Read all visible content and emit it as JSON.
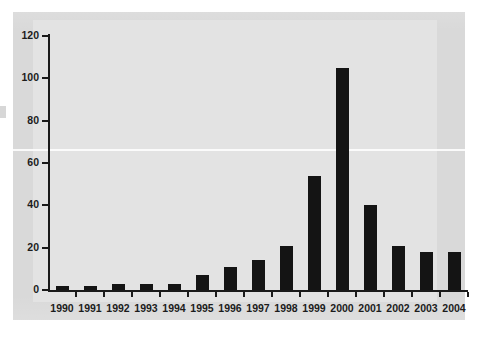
{
  "chart_data": {
    "type": "bar",
    "title": "",
    "subtitle": "",
    "xlabel": "",
    "ylabel": "",
    "categories": [
      "1990",
      "1991",
      "1992",
      "1993",
      "1994",
      "1995",
      "1996",
      "1997",
      "1998",
      "1999",
      "2000",
      "2001",
      "2002",
      "2003",
      "2004"
    ],
    "values": [
      2,
      2,
      3,
      3,
      3,
      7,
      11,
      14,
      21,
      54,
      105,
      40,
      21,
      18,
      18
    ],
    "series": [
      {
        "name": "count",
        "values": [
          2,
          2,
          3,
          3,
          3,
          7,
          11,
          14,
          21,
          54,
          105,
          40,
          21,
          18,
          18
        ]
      }
    ],
    "ylim": [
      0,
      120
    ],
    "y_ticks": [
      0,
      20,
      40,
      60,
      80,
      100,
      120
    ],
    "y_tick_labels": [
      "0",
      "20",
      "40",
      "60",
      "80",
      "100",
      "120"
    ],
    "grid": false,
    "legend": null,
    "legend_position": "none",
    "bar_color": "#141414",
    "axis_color": "#1a1a1a",
    "background_color": "#d9d9d9",
    "plot_background_color": "#e3e3e3",
    "annotations": []
  }
}
